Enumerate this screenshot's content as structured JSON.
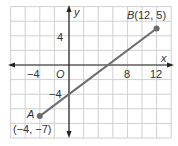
{
  "chart_data": {
    "type": "line",
    "title": "",
    "xlabel": "x",
    "ylabel": "y",
    "xlim": [
      -8,
      14
    ],
    "ylim": [
      -10,
      8
    ],
    "grid": true,
    "grid_step": 2,
    "x_ticks": [
      {
        "value": -4,
        "label": "−4"
      },
      {
        "value": 8,
        "label": "8"
      },
      {
        "value": 12,
        "label": "12"
      }
    ],
    "y_ticks": [
      {
        "value": 4,
        "label": "4"
      },
      {
        "value": -4,
        "label": "−4"
      }
    ],
    "origin_label": "O",
    "segment": {
      "points": [
        {
          "name": "A",
          "x": -4,
          "y": -7,
          "label": "(−4, −7)"
        },
        {
          "name": "B",
          "x": 12,
          "y": 5,
          "label": "B(12, 5)"
        }
      ]
    }
  },
  "labels": {
    "x_axis": "x",
    "y_axis": "y",
    "origin": "O",
    "tick_x_neg4": "−4",
    "tick_x_8": "8",
    "tick_x_12": "12",
    "tick_y_4": "4",
    "tick_y_neg4": "−4",
    "point_a_name": "A",
    "point_a_coords": "(−4, −7)",
    "point_b_label": "B(12, 5)"
  },
  "colors": {
    "grid": "#d0d0d0",
    "axis": "#222222",
    "segment": "#6b6b6b",
    "point": "#6b6b6b",
    "text": "#333333"
  }
}
